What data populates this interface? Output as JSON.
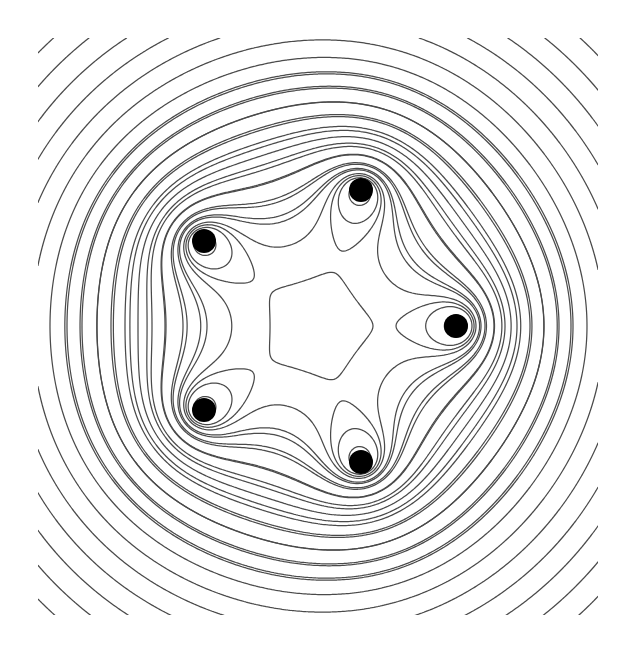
{
  "figure": {
    "title": "Contour lines of a pentagonal point-vortex / point-charge field"
  },
  "chart_data": {
    "type": "contour",
    "title": "",
    "xlabel": "",
    "ylabel": "",
    "axes_visible": false,
    "grid": false,
    "legend": null,
    "canvas_px": {
      "width": 636,
      "height": 653
    },
    "frame_px": {
      "x0": 38,
      "y0": 38,
      "x1": 598,
      "y1": 615
    },
    "center_px": {
      "x": 317,
      "y": 326
    },
    "ring_radius_px": 141,
    "points": [
      {
        "label": "right",
        "angle_deg": 0,
        "x": 456,
        "y": 326
      },
      {
        "label": "bottom",
        "angle_deg": 72,
        "x": 361,
        "y": 462
      },
      {
        "label": "lower-left",
        "angle_deg": 144,
        "x": 204,
        "y": 410
      },
      {
        "label": "upper-left",
        "angle_deg": 216,
        "x": 204,
        "y": 241
      },
      {
        "label": "top",
        "angle_deg": 288,
        "x": 361,
        "y": 190
      }
    ],
    "point_radius_px": 12,
    "point_color": "#000000",
    "field": {
      "formula": "f(z) = sum_k log|z - z_k| + c * |z|^2   (z in units of ring radius)",
      "c": 0.3
    },
    "contour_crossings_right_axis_px": [
      467,
      476,
      485,
      494,
      505,
      517,
      530,
      544,
      559,
      573,
      587
    ],
    "contour_crossings_left_axis_px": [
      207,
      183,
      165,
      152,
      138,
      125,
      111,
      97,
      82,
      67,
      50
    ],
    "inner_lobe_tip_px": 396,
    "extra_outer_levels": 6,
    "line_color": "#4a4a4a",
    "line_width": 1.25
  }
}
